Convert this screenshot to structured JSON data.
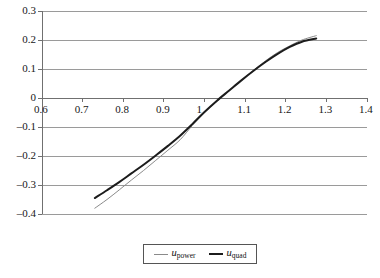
{
  "chart_data": {
    "type": "line",
    "title": "",
    "subtitle": "",
    "xlabel": "",
    "ylabel": "",
    "xlim": [
      0.6,
      1.4
    ],
    "ylim": [
      -0.4,
      0.3
    ],
    "grid": true,
    "grid_orientation": "horizontal",
    "legend_position": "bottom-center",
    "x_ticks": [
      "0.6",
      "0.7",
      "0.8",
      "0.9",
      "1",
      "1.1",
      "1.2",
      "1.3",
      "1.4"
    ],
    "x_tick_values": [
      0.6,
      0.7,
      0.8,
      0.9,
      1.0,
      1.1,
      1.2,
      1.3,
      1.4
    ],
    "y_ticks": [
      "0.3",
      "0.2",
      "0.1",
      "0",
      "–0.1",
      "–0.2",
      "–0.3",
      "–0.4"
    ],
    "y_tick_values": [
      0.3,
      0.2,
      0.1,
      0.0,
      -0.1,
      -0.2,
      -0.3,
      -0.4
    ],
    "axis_zero_line": 0.0,
    "series": [
      {
        "name": "u_power",
        "legend_label_var": "u",
        "legend_label_sub": "power",
        "color": "#8a8a8a",
        "width": 1,
        "x": [
          0.73,
          0.76,
          0.79,
          0.82,
          0.85,
          0.88,
          0.91,
          0.94,
          0.97,
          1.0,
          1.03,
          1.06,
          1.09,
          1.12,
          1.15,
          1.18,
          1.21,
          1.24,
          1.275
        ],
        "values": [
          -0.38,
          -0.35,
          -0.317,
          -0.283,
          -0.25,
          -0.215,
          -0.18,
          -0.144,
          -0.095,
          -0.05,
          -0.012,
          0.025,
          0.06,
          0.095,
          0.128,
          0.157,
          0.18,
          0.2,
          0.215
        ]
      },
      {
        "name": "u_quad",
        "legend_label_var": "u",
        "legend_label_sub": "quad",
        "color": "#1c1c1c",
        "width": 2,
        "x": [
          0.73,
          0.76,
          0.79,
          0.82,
          0.85,
          0.88,
          0.91,
          0.94,
          0.97,
          1.0,
          1.03,
          1.06,
          1.09,
          1.12,
          1.15,
          1.18,
          1.21,
          1.24,
          1.275
        ],
        "values": [
          -0.345,
          -0.318,
          -0.29,
          -0.26,
          -0.23,
          -0.198,
          -0.165,
          -0.13,
          -0.09,
          -0.048,
          -0.01,
          0.025,
          0.06,
          0.093,
          0.124,
          0.152,
          0.176,
          0.194,
          0.205
        ]
      }
    ],
    "colors": {
      "gridline": "#9a9a9a",
      "axis": "#707070",
      "plot_border": "#8c8c8c",
      "background": "#ffffff",
      "series_power": "#8a8a8a",
      "series_quad": "#1c1c1c",
      "legend_border": "#555555"
    }
  }
}
